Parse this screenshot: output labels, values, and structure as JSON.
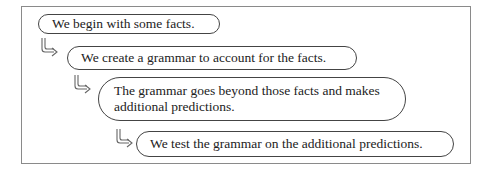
{
  "diagram": {
    "type": "sequential-steps",
    "steps": [
      {
        "id": 1,
        "text": "We begin with some facts."
      },
      {
        "id": 2,
        "text": "We create a grammar to account for the facts."
      },
      {
        "id": 3,
        "text": "The grammar goes beyond those facts and makes additional predictions.",
        "lines": [
          "The grammar goes beyond those facts and makes",
          "additional predictions."
        ]
      },
      {
        "id": 4,
        "text": "We test the grammar on the additional predictions."
      }
    ],
    "connector_icon": "hooked-right-arrow-icon",
    "colors": {
      "border": "#444444",
      "frame": "#8a8a8a",
      "text": "#222222",
      "background": "#ffffff"
    }
  }
}
